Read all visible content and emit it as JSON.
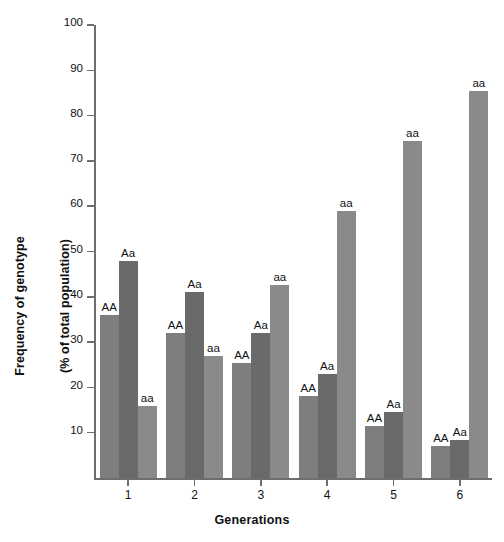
{
  "chart_data": {
    "type": "bar",
    "title": "",
    "xlabel": "Generations",
    "ylabel": "Frequency of genotype\n(% of total population)",
    "ylabel_line1": "Frequency of genotype",
    "ylabel_line2": "(% of total population)",
    "categories": [
      "1",
      "2",
      "3",
      "4",
      "5",
      "6"
    ],
    "ylim": [
      0,
      100
    ],
    "y_ticks": [
      10,
      20,
      30,
      40,
      50,
      60,
      70,
      80,
      90,
      100
    ],
    "grid": false,
    "legend": "none",
    "bar_labels_above": true,
    "series": [
      {
        "name": "AA",
        "color": "#7e7e7e",
        "values": [
          36,
          32,
          25.5,
          18,
          11.5,
          7
        ]
      },
      {
        "name": "Aa",
        "color": "#6a6a6a",
        "values": [
          48,
          41,
          32,
          23,
          14.5,
          8.5
        ]
      },
      {
        "name": "aa",
        "color": "#8a8a8a",
        "values": [
          16,
          27,
          42.5,
          59,
          74.5,
          85.5
        ]
      }
    ],
    "point_labels": [
      [
        "AA",
        "Aa",
        "aa"
      ],
      [
        "AA",
        "Aa",
        "aa"
      ],
      [
        "AA",
        "Aa",
        "aa"
      ],
      [
        "AA",
        "Aa",
        "aa"
      ],
      [
        "AA",
        "Aa",
        "aa"
      ],
      [
        "AA",
        "Aa",
        "aa"
      ]
    ],
    "axis_color": "#6e6e6e",
    "background_color": "#ffffff"
  }
}
